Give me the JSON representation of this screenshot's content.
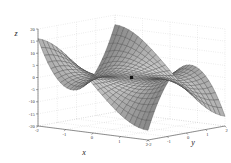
{
  "figure": {
    "type": "surface-plot",
    "background_color": "#ffffff",
    "mesh_color": "#3d3d3d",
    "face_color": "#b4b4b4",
    "grid_color": "#bdbdbd",
    "axis_color": "#555555",
    "marker_color": "#141414"
  },
  "axes": {
    "x": {
      "label": "x",
      "ticks": [
        "-2",
        "-1",
        "0",
        "1",
        "2"
      ],
      "values": [
        -2,
        -1,
        0,
        1,
        2
      ],
      "range": [
        -2,
        2
      ]
    },
    "y": {
      "label": "y",
      "ticks": [
        "-2",
        "-1",
        "0",
        "1",
        "2"
      ],
      "values": [
        -2,
        -1,
        0,
        1,
        2
      ],
      "range": [
        -2,
        2
      ]
    },
    "z": {
      "label": "z",
      "ticks": [
        "20",
        "15",
        "10",
        "5",
        "0",
        "-5",
        "-10",
        "-15",
        "-20"
      ],
      "values": [
        20,
        15,
        10,
        5,
        0,
        -5,
        -10,
        -15,
        -20
      ],
      "range": [
        -20,
        20
      ]
    }
  },
  "marker": {
    "name": "origin-marker",
    "x": 0,
    "y": 0,
    "z": 0
  },
  "chart_data": {
    "type": "surface",
    "title": "",
    "xlabel": "x",
    "ylabel": "y",
    "zlabel": "z",
    "xlim": [
      -2,
      2
    ],
    "ylim": [
      -2,
      2
    ],
    "zlim": [
      -20,
      20
    ],
    "xticks": [
      -2,
      -1,
      0,
      1,
      2
    ],
    "yticks": [
      -2,
      -1,
      0,
      1,
      2
    ],
    "zticks": [
      -20,
      -15,
      -10,
      -5,
      0,
      5,
      10,
      15,
      20
    ],
    "grid": true,
    "legend": null,
    "surface_formula": "z = x^3 - 3*x*y^2",
    "mesh_n": 25,
    "view": {
      "azimuth": -37.5,
      "elevation": 30
    },
    "annotations": [
      {
        "label": "",
        "x": 0,
        "y": 0,
        "z": 0,
        "marker": "square",
        "color": "#141414"
      }
    ],
    "z_at_corners": {
      "x=-2,y=-2": 4,
      "x=-2,y=2": 4,
      "x=2,y=-2": -4,
      "x=2,y=2": -4,
      "x=-2,y=0": -8,
      "x=2,y=0": 8,
      "x=0,y=-2": 0,
      "x=0,y=2": 0
    }
  }
}
